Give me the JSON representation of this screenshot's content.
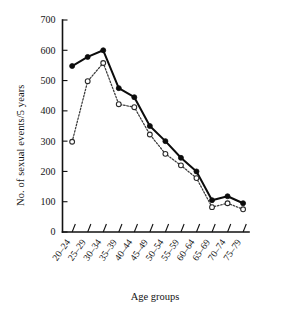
{
  "chart_data": {
    "type": "line",
    "title": "",
    "xlabel": "Age groups",
    "ylabel": "No. of sexual events/5 years",
    "categories": [
      "20–24",
      "25–29",
      "30–34",
      "35–39",
      "40–44",
      "45–49",
      "50–54",
      "55–59",
      "60–64",
      "65–69",
      "70–74",
      "75–79"
    ],
    "ylim": [
      0,
      700
    ],
    "yticks": [
      0,
      100,
      200,
      300,
      400,
      500,
      600,
      700
    ],
    "ytick_labels": [
      "0",
      "100",
      "200",
      "300",
      "400",
      "500",
      "600",
      "700"
    ],
    "grid": false,
    "legend": "none",
    "series": [
      {
        "name": "solid-filled-circles",
        "marker": "filled-circle",
        "linestyle": "solid",
        "color": "#0c0c0c",
        "values": [
          548,
          578,
          600,
          475,
          445,
          350,
          300,
          245,
          200,
          105,
          118,
          95
        ]
      },
      {
        "name": "dotted-open-circles",
        "marker": "open-circle",
        "linestyle": "dotted",
        "color": "#3a3a3a",
        "values": [
          298,
          498,
          558,
          422,
          412,
          322,
          258,
          220,
          178,
          82,
          95,
          75
        ]
      }
    ]
  }
}
